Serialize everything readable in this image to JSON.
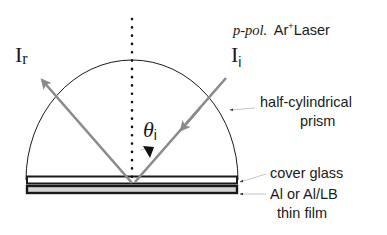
{
  "diagram": {
    "type": "optical-setup",
    "labels": {
      "laser_italic": "p-pol.",
      "laser_species": "Ar",
      "laser_superscript": "+",
      "laser_name": "Laser",
      "incident_main": "I",
      "incident_sub": "i",
      "reflected_main": "I",
      "reflected_sub": "r",
      "angle_main": "θ",
      "angle_sub": "i",
      "prism_line1": "half-cylindrical",
      "prism_line2": "prism",
      "cover_glass": "cover glass",
      "film_line1": "Al or Al/LB",
      "film_line2": "thin film"
    },
    "colors": {
      "beam": "#8a8a8a",
      "outline": "#1a1a1a",
      "film_fill": "#d4d4d4",
      "pointer": "#bdbdbd",
      "background": "#ffffff"
    },
    "geometry": {
      "reflection_point": [
        132,
        183
      ],
      "prism_radius": 106,
      "incidence_angle_deg": 42
    }
  }
}
